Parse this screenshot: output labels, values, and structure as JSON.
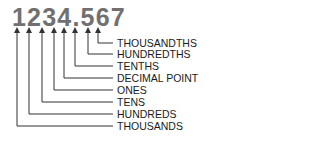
{
  "diagram": {
    "number": "1234.567",
    "labels": [
      {
        "text": "THOUSANDTHS",
        "digit": "7"
      },
      {
        "text": "HUNDREDTHS",
        "digit": "6"
      },
      {
        "text": "TENTHS",
        "digit": "5"
      },
      {
        "text": "DECIMAL POINT",
        "digit": "."
      },
      {
        "text": "ONES",
        "digit": "4"
      },
      {
        "text": "TENS",
        "digit": "3"
      },
      {
        "text": "HUNDREDS",
        "digit": "2"
      },
      {
        "text": "THOUSANDS",
        "digit": "1"
      }
    ],
    "colors": {
      "number": "#707070",
      "lines": "#333333",
      "labels": "#1a1a1a"
    }
  }
}
